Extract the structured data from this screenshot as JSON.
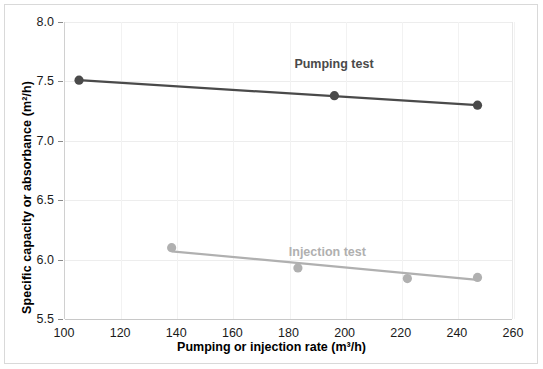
{
  "chart_data": {
    "type": "scatter",
    "title": "",
    "xlabel": "Pumping or injection rate  (m³/h)",
    "ylabel": "Specific capacity or absorbance  (m²/h)",
    "xlim": [
      100,
      260
    ],
    "ylim": [
      5.5,
      8.0
    ],
    "xticks": [
      "100",
      "120",
      "140",
      "160",
      "180",
      "200",
      "220",
      "240",
      "260"
    ],
    "xtick_values": [
      100,
      120,
      140,
      160,
      180,
      200,
      220,
      240,
      260
    ],
    "yticks": [
      "5.5",
      "6.0",
      "6.5",
      "7.0",
      "7.5",
      "8.0"
    ],
    "ytick_values": [
      5.5,
      6.0,
      6.5,
      7.0,
      7.5,
      8.0
    ],
    "grid": "horizontal",
    "legend_position": "inline-annotation",
    "series": [
      {
        "name": "Pumping test",
        "color": "#4a4a4a",
        "marker": "circle",
        "x": [
          105,
          196,
          247
        ],
        "y": [
          7.51,
          7.38,
          7.3
        ],
        "trendline": {
          "x": [
            105,
            247
          ],
          "y": [
            7.51,
            7.3
          ]
        },
        "label_x": 196,
        "label_y": 7.63
      },
      {
        "name": "Injection test",
        "color": "#b0b0b0",
        "marker": "circle",
        "x": [
          138,
          183,
          222,
          247
        ],
        "y": [
          6.1,
          5.93,
          5.84,
          5.85
        ],
        "trendline": {
          "x": [
            138,
            247
          ],
          "y": [
            6.07,
            5.83
          ]
        },
        "label_x": 194,
        "label_y": 6.05
      }
    ]
  },
  "annotations": {
    "pumping_label": "Pumping test",
    "injection_label": "Injection test"
  }
}
